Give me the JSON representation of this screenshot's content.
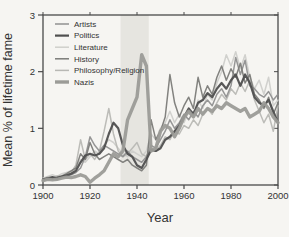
{
  "figure": {
    "background": "#f6f5f2",
    "axis_color": "#4a4a4a",
    "text_color": "#333333"
  },
  "chart_data": {
    "type": "line",
    "title": "",
    "xlabel": "Year",
    "ylabel": "Mean % of lifetime fame",
    "xlim": [
      1900,
      2000
    ],
    "ylim": [
      0,
      3
    ],
    "x_ticks": [
      1900,
      1920,
      1940,
      1960,
      1980,
      2000
    ],
    "y_ticks": [
      0,
      1,
      2,
      3
    ],
    "grid": false,
    "legend_position": "top-left",
    "shaded_band": {
      "x_start": 1933,
      "x_end": 1945,
      "color": "#e6e5e0"
    },
    "x": [
      1900,
      1902,
      1904,
      1906,
      1908,
      1910,
      1912,
      1914,
      1916,
      1918,
      1920,
      1922,
      1924,
      1926,
      1928,
      1930,
      1932,
      1934,
      1936,
      1938,
      1940,
      1942,
      1944,
      1946,
      1948,
      1950,
      1952,
      1954,
      1956,
      1958,
      1960,
      1962,
      1964,
      1966,
      1968,
      1970,
      1972,
      1974,
      1976,
      1978,
      1980,
      1982,
      1984,
      1986,
      1988,
      1990,
      1992,
      1994,
      1996,
      1998,
      2000
    ],
    "series": [
      {
        "name": "Artists",
        "color": "#909090",
        "width": 1.5,
        "values": [
          0.08,
          0.1,
          0.12,
          0.1,
          0.14,
          0.16,
          0.18,
          0.22,
          0.3,
          0.5,
          0.85,
          0.7,
          0.6,
          0.7,
          0.65,
          0.6,
          0.55,
          0.5,
          0.6,
          0.5,
          0.45,
          0.4,
          0.5,
          0.7,
          0.65,
          0.8,
          0.95,
          1.15,
          1.0,
          1.1,
          1.25,
          1.15,
          1.3,
          1.2,
          1.4,
          1.5,
          1.4,
          1.6,
          1.7,
          1.55,
          1.75,
          2.25,
          1.95,
          2.2,
          1.75,
          1.7,
          1.6,
          1.55,
          1.65,
          1.5,
          1.6
        ]
      },
      {
        "name": "Politics",
        "color": "#4f4f4f",
        "width": 2.2,
        "values": [
          0.1,
          0.12,
          0.14,
          0.12,
          0.15,
          0.17,
          0.2,
          0.25,
          0.4,
          0.52,
          0.55,
          0.52,
          0.55,
          0.65,
          0.9,
          1.1,
          1.0,
          0.7,
          0.55,
          0.5,
          0.35,
          0.3,
          0.45,
          0.62,
          0.6,
          0.65,
          0.8,
          0.85,
          0.95,
          1.05,
          1.2,
          1.35,
          1.25,
          1.45,
          1.5,
          1.62,
          1.55,
          1.7,
          1.8,
          1.7,
          1.85,
          1.95,
          1.75,
          1.95,
          1.8,
          1.55,
          1.45,
          1.4,
          1.5,
          1.3,
          1.1
        ]
      },
      {
        "name": "Literature",
        "color": "#cfcfcb",
        "width": 1.5,
        "values": [
          0.12,
          0.15,
          0.18,
          0.15,
          0.2,
          0.22,
          0.25,
          0.3,
          0.45,
          0.4,
          0.5,
          0.6,
          0.55,
          0.7,
          0.8,
          0.75,
          0.65,
          0.55,
          0.5,
          0.6,
          0.55,
          0.5,
          0.6,
          0.9,
          0.8,
          1.0,
          1.1,
          1.3,
          1.1,
          1.25,
          1.1,
          1.3,
          1.2,
          1.5,
          1.35,
          1.6,
          1.5,
          1.8,
          2.0,
          2.3,
          2.1,
          2.35,
          2.05,
          2.3,
          1.9,
          1.7,
          1.85,
          1.6,
          1.9,
          1.4,
          1.5
        ]
      },
      {
        "name": "History",
        "color": "#7b7b78",
        "width": 1.5,
        "values": [
          0.1,
          0.12,
          0.1,
          0.14,
          0.16,
          0.2,
          0.25,
          0.3,
          0.55,
          0.45,
          0.75,
          0.55,
          0.45,
          0.5,
          0.55,
          0.5,
          0.45,
          0.4,
          0.45,
          0.35,
          0.3,
          0.25,
          0.35,
          1.15,
          0.8,
          0.95,
          1.2,
          1.95,
          1.45,
          1.2,
          1.4,
          1.55,
          1.35,
          1.9,
          1.55,
          1.75,
          1.6,
          1.9,
          2.1,
          1.85,
          2.05,
          1.9,
          2.15,
          1.8,
          1.95,
          1.6,
          1.5,
          1.35,
          1.55,
          1.25,
          1.45
        ]
      },
      {
        "name": "Philosophy/Religion",
        "color": "#b8b8b4",
        "width": 1.5,
        "values": [
          0.1,
          0.14,
          0.12,
          0.16,
          0.14,
          0.18,
          0.22,
          0.35,
          0.8,
          0.45,
          0.55,
          0.45,
          0.6,
          0.95,
          1.35,
          0.9,
          0.6,
          0.5,
          0.55,
          0.65,
          0.75,
          0.55,
          0.5,
          0.65,
          0.6,
          0.7,
          0.85,
          0.8,
          0.95,
          0.9,
          1.05,
          1.0,
          1.15,
          1.05,
          1.25,
          1.35,
          1.25,
          1.45,
          1.6,
          1.5,
          1.7,
          1.6,
          1.8,
          1.65,
          1.85,
          1.5,
          1.3,
          1.1,
          1.25,
          0.95,
          1.4
        ]
      },
      {
        "name": "Nazis",
        "color": "#9b9b97",
        "width": 3.4,
        "values": [
          0.08,
          0.1,
          0.09,
          0.1,
          0.12,
          0.14,
          0.13,
          0.15,
          0.18,
          0.15,
          0.05,
          0.12,
          0.18,
          0.25,
          0.4,
          0.55,
          0.5,
          0.6,
          1.15,
          1.35,
          1.55,
          2.3,
          2.1,
          0.6,
          0.65,
          0.95,
          1.05,
          1.0,
          0.85,
          1.0,
          1.2,
          1.3,
          1.2,
          1.35,
          1.25,
          1.35,
          1.3,
          1.4,
          1.35,
          1.45,
          1.4,
          1.35,
          1.3,
          1.35,
          1.2,
          1.25,
          1.3,
          1.45,
          1.35,
          1.2,
          1.1
        ]
      }
    ]
  }
}
